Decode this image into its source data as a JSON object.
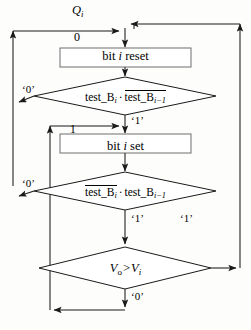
{
  "diagram": {
    "type": "flowchart",
    "entry_label": "Q_i",
    "nodes": [
      {
        "id": "box-bit-reset",
        "shape": "process",
        "text_plain": "bit i reset",
        "text_prefix": "bit ",
        "text_italic": "i",
        "text_suffix": " reset"
      },
      {
        "id": "decision-test-1",
        "shape": "decision",
        "text_plain": "test_B_i · NOT test_B_(i-1)",
        "term1_base": "test_B",
        "term1_sub": "i",
        "term1_overline": false,
        "operator": "·",
        "term2_base": "test_B",
        "term2_sub": "i−1",
        "term2_overline": true
      },
      {
        "id": "box-bit-set",
        "shape": "process",
        "text_plain": "bit i set",
        "text_prefix": "bit ",
        "text_italic": "i",
        "text_suffix": " set"
      },
      {
        "id": "decision-test-2",
        "shape": "decision",
        "text_plain": "NOT test_B_i · test_B_(i-1)",
        "term1_base": "test_B",
        "term1_sub": "i",
        "term1_overline": true,
        "operator": "·",
        "term2_base": "test_B",
        "term2_sub": "i−1",
        "term2_overline": false
      },
      {
        "id": "decision-compare",
        "shape": "decision",
        "text_plain": "Vo > Vi",
        "lhs_base": "V",
        "lhs_sub": "o",
        "comparator": ">",
        "rhs_base": "V",
        "rhs_sub": "i"
      }
    ],
    "edge_labels": {
      "entry_q": "Q",
      "entry_q_sub": "i",
      "entry_zero": "0",
      "merge_one": "1",
      "test1_false": "‘0’",
      "test1_true": "‘1’",
      "test2_false": "‘0’",
      "test2_true": "‘1’",
      "compare_true": "‘1’",
      "compare_false": "‘0’"
    },
    "colors": {
      "stroke": "#1a1a1a",
      "text": "#000000",
      "background": "#fdfdfc",
      "box_fill": "#ffffff"
    }
  }
}
